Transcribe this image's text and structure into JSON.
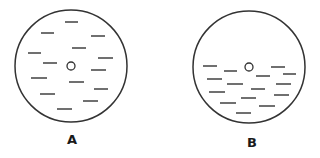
{
  "stroke_color": "#333333",
  "background_color": "#ffffff",
  "panels": [
    {
      "label": "A",
      "description": "uniform distribution",
      "circle": {
        "cx": 71,
        "cy": 66,
        "r": 56
      },
      "center_marker": {
        "cx": 71,
        "cy": 66,
        "r": 4
      },
      "label_pos": {
        "x": 62,
        "y": 132
      },
      "dashes": [
        [
          65,
          22,
          78,
          22
        ],
        [
          41,
          33,
          54,
          33
        ],
        [
          91,
          36,
          105,
          36
        ],
        [
          28,
          53,
          41,
          53
        ],
        [
          72,
          48,
          86,
          48
        ],
        [
          98,
          58,
          113,
          58
        ],
        [
          43,
          63,
          57,
          63
        ],
        [
          91,
          70,
          106,
          70
        ],
        [
          31,
          78,
          47,
          78
        ],
        [
          69,
          82,
          84,
          82
        ],
        [
          94,
          89,
          108,
          89
        ],
        [
          40,
          94,
          55,
          94
        ],
        [
          83,
          101,
          98,
          101
        ],
        [
          57,
          109,
          72,
          109
        ]
      ]
    },
    {
      "label": "B",
      "description": "settled distribution (lower half)",
      "circle": {
        "cx": 249,
        "cy": 67,
        "r": 56
      },
      "center_marker": {
        "cx": 249,
        "cy": 67,
        "r": 4
      },
      "label_pos": {
        "x": 242,
        "y": 135
      },
      "dashes": [
        [
          203,
          66,
          217,
          66
        ],
        [
          224,
          71,
          237,
          71
        ],
        [
          271,
          67,
          285,
          67
        ],
        [
          283,
          74,
          296,
          74
        ],
        [
          256,
          76,
          270,
          76
        ],
        [
          207,
          79,
          222,
          79
        ],
        [
          227,
          84,
          243,
          84
        ],
        [
          276,
          84,
          291,
          84
        ],
        [
          251,
          89,
          265,
          89
        ],
        [
          209,
          92,
          225,
          92
        ],
        [
          274,
          95,
          289,
          95
        ],
        [
          241,
          98,
          256,
          98
        ],
        [
          220,
          103,
          236,
          103
        ],
        [
          259,
          106,
          275,
          106
        ],
        [
          236,
          113,
          251,
          113
        ]
      ]
    }
  ]
}
